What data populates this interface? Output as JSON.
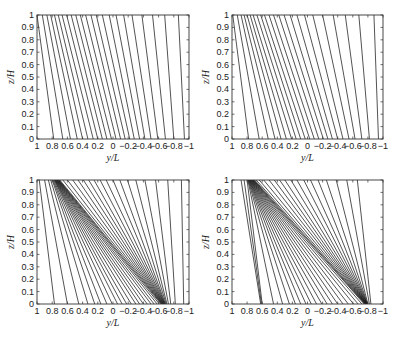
{
  "figure": {
    "width": 400,
    "height": 339,
    "line_color": "#1a1a1a",
    "axes_color": "#333333",
    "background": "#ffffff"
  },
  "chart_data": [
    {
      "id": "top-left",
      "type": "line",
      "title": "",
      "xlabel": "y/L",
      "ylabel": "z/H",
      "xlim": [
        1,
        -1
      ],
      "ylim": [
        0,
        1
      ],
      "x_reversed": true,
      "grid": false,
      "xticks": [
        1,
        0.8,
        0.6,
        0.4,
        0.2,
        0,
        -0.2,
        -0.4,
        -0.6,
        -0.8,
        -1
      ],
      "xtick_labels": [
        "1",
        "0.8",
        "0.6",
        "0.4",
        "0.2",
        "0",
        "−0.2",
        "−0.4",
        "−0.6",
        "−0.8",
        "−1"
      ],
      "yticks": [
        0,
        0.1,
        0.2,
        0.3,
        0.4,
        0.5,
        0.6,
        0.7,
        0.8,
        0.9,
        1
      ],
      "ytick_labels": [
        "0",
        "0.1",
        "0.2",
        "0.3",
        "0.4",
        "0.5",
        "0.6",
        "0.7",
        "0.8",
        "0.9",
        "1"
      ],
      "pixel_box": {
        "x0": 37,
        "y0": 15,
        "x1": 189,
        "y1": 139
      },
      "description": "Nearly parallel streamlines tilted from upper-left to lower-right",
      "lines": [
        {
          "x_top": 1.0,
          "x_bottom": 0.78
        },
        {
          "x_top": 0.93,
          "x_bottom": 0.66
        },
        {
          "x_top": 0.87,
          "x_bottom": 0.56
        },
        {
          "x_top": 0.82,
          "x_bottom": 0.47
        },
        {
          "x_top": 0.77,
          "x_bottom": 0.4
        },
        {
          "x_top": 0.72,
          "x_bottom": 0.33
        },
        {
          "x_top": 0.67,
          "x_bottom": 0.26
        },
        {
          "x_top": 0.61,
          "x_bottom": 0.2
        },
        {
          "x_top": 0.55,
          "x_bottom": 0.14
        },
        {
          "x_top": 0.49,
          "x_bottom": 0.08
        },
        {
          "x_top": 0.43,
          "x_bottom": 0.02
        },
        {
          "x_top": 0.36,
          "x_bottom": -0.04
        },
        {
          "x_top": 0.29,
          "x_bottom": -0.1
        },
        {
          "x_top": 0.22,
          "x_bottom": -0.16
        },
        {
          "x_top": 0.14,
          "x_bottom": -0.22
        },
        {
          "x_top": 0.05,
          "x_bottom": -0.28
        },
        {
          "x_top": -0.04,
          "x_bottom": -0.35
        },
        {
          "x_top": -0.14,
          "x_bottom": -0.42
        },
        {
          "x_top": -0.25,
          "x_bottom": -0.5
        },
        {
          "x_top": -0.38,
          "x_bottom": -0.59
        },
        {
          "x_top": -0.52,
          "x_bottom": -0.69
        },
        {
          "x_top": -0.68,
          "x_bottom": -0.8
        },
        {
          "x_top": -0.86,
          "x_bottom": -0.94
        }
      ]
    },
    {
      "id": "top-right",
      "type": "line",
      "title": "",
      "xlabel": "y/L",
      "ylabel": "z/H",
      "xlim": [
        1,
        -1
      ],
      "ylim": [
        0,
        1
      ],
      "x_reversed": true,
      "grid": false,
      "xticks": [
        1,
        0.8,
        0.6,
        0.4,
        0.2,
        0,
        -0.2,
        -0.4,
        -0.6,
        -0.8,
        -1
      ],
      "xtick_labels": [
        "1",
        "0.8",
        "0.6",
        "0.4",
        "0.2",
        "0",
        "−0.2",
        "−0.4",
        "−0.6",
        "−0.8",
        "−1"
      ],
      "yticks": [
        0,
        0.1,
        0.2,
        0.3,
        0.4,
        0.5,
        0.6,
        0.7,
        0.8,
        0.9,
        1
      ],
      "ytick_labels": [
        "0",
        "0.1",
        "0.2",
        "0.3",
        "0.4",
        "0.5",
        "0.6",
        "0.7",
        "0.8",
        "0.9",
        "1"
      ],
      "pixel_box": {
        "x0": 232,
        "y0": 15,
        "x1": 383,
        "y1": 139
      },
      "description": "Streamlines slightly converging, tilted from upper-left to lower-right",
      "lines": [
        {
          "x_top": 0.99,
          "x_bottom": 0.78
        },
        {
          "x_top": 0.93,
          "x_bottom": 0.64
        },
        {
          "x_top": 0.88,
          "x_bottom": 0.52
        },
        {
          "x_top": 0.84,
          "x_bottom": 0.43
        },
        {
          "x_top": 0.8,
          "x_bottom": 0.35
        },
        {
          "x_top": 0.76,
          "x_bottom": 0.28
        },
        {
          "x_top": 0.72,
          "x_bottom": 0.21
        },
        {
          "x_top": 0.67,
          "x_bottom": 0.15
        },
        {
          "x_top": 0.62,
          "x_bottom": 0.09
        },
        {
          "x_top": 0.57,
          "x_bottom": 0.03
        },
        {
          "x_top": 0.51,
          "x_bottom": -0.03
        },
        {
          "x_top": 0.45,
          "x_bottom": -0.09
        },
        {
          "x_top": 0.38,
          "x_bottom": -0.15
        },
        {
          "x_top": 0.31,
          "x_bottom": -0.21
        },
        {
          "x_top": 0.23,
          "x_bottom": -0.27
        },
        {
          "x_top": 0.14,
          "x_bottom": -0.33
        },
        {
          "x_top": 0.04,
          "x_bottom": -0.4
        },
        {
          "x_top": -0.07,
          "x_bottom": -0.47
        },
        {
          "x_top": -0.2,
          "x_bottom": -0.55
        },
        {
          "x_top": -0.34,
          "x_bottom": -0.63
        },
        {
          "x_top": -0.5,
          "x_bottom": -0.72
        },
        {
          "x_top": -0.68,
          "x_bottom": -0.82
        },
        {
          "x_top": -0.88,
          "x_bottom": -0.94
        }
      ]
    },
    {
      "id": "bottom-left",
      "type": "line",
      "title": "",
      "xlabel": "y/L",
      "ylabel": "z/H",
      "xlim": [
        1,
        -1
      ],
      "ylim": [
        0,
        1
      ],
      "x_reversed": true,
      "grid": false,
      "xticks": [
        1,
        0.8,
        0.6,
        0.4,
        0.2,
        0,
        -0.2,
        -0.4,
        -0.6,
        -0.8,
        -1
      ],
      "xtick_labels": [
        "1",
        "0.8",
        "0.6",
        "0.4",
        "0.2",
        "0",
        "−0.2",
        "−0.4",
        "−0.6",
        "−0.8",
        "−1"
      ],
      "yticks": [
        0,
        0.1,
        0.2,
        0.3,
        0.4,
        0.5,
        0.6,
        0.7,
        0.8,
        0.9,
        1
      ],
      "ytick_labels": [
        "0",
        "0.1",
        "0.2",
        "0.3",
        "0.4",
        "0.5",
        "0.6",
        "0.7",
        "0.8",
        "0.9",
        "1"
      ],
      "pixel_box": {
        "x0": 37,
        "y0": 180,
        "x1": 189,
        "y1": 304
      },
      "description": "Streamlines converging into a dense diagonal band from (0.75,1) to (-0.65,0)",
      "lines": [
        {
          "x_top": 0.97,
          "x_bottom": 0.77
        },
        {
          "x_top": 0.9,
          "x_bottom": 0.6
        },
        {
          "x_top": 0.85,
          "x_bottom": 0.45
        },
        {
          "x_top": 0.82,
          "x_bottom": 0.33
        },
        {
          "x_top": 0.8,
          "x_bottom": 0.24
        },
        {
          "x_top": 0.79,
          "x_bottom": 0.16
        },
        {
          "x_top": 0.78,
          "x_bottom": 0.08
        },
        {
          "x_top": 0.77,
          "x_bottom": 0.01
        },
        {
          "x_top": 0.765,
          "x_bottom": -0.06
        },
        {
          "x_top": 0.76,
          "x_bottom": -0.12
        },
        {
          "x_top": 0.755,
          "x_bottom": -0.18
        },
        {
          "x_top": 0.75,
          "x_bottom": -0.24
        },
        {
          "x_top": 0.745,
          "x_bottom": -0.3
        },
        {
          "x_top": 0.74,
          "x_bottom": -0.35
        },
        {
          "x_top": 0.735,
          "x_bottom": -0.4
        },
        {
          "x_top": 0.73,
          "x_bottom": -0.45
        },
        {
          "x_top": 0.725,
          "x_bottom": -0.5
        },
        {
          "x_top": 0.72,
          "x_bottom": -0.54
        },
        {
          "x_top": 0.715,
          "x_bottom": -0.58
        },
        {
          "x_top": 0.71,
          "x_bottom": -0.61
        },
        {
          "x_top": 0.7,
          "x_bottom": -0.63
        },
        {
          "x_top": 0.66,
          "x_bottom": -0.64
        },
        {
          "x_top": 0.6,
          "x_bottom": -0.645
        },
        {
          "x_top": 0.53,
          "x_bottom": -0.65
        },
        {
          "x_top": 0.46,
          "x_bottom": -0.655
        },
        {
          "x_top": 0.39,
          "x_bottom": -0.66
        },
        {
          "x_top": 0.32,
          "x_bottom": -0.665
        },
        {
          "x_top": 0.25,
          "x_bottom": -0.67
        },
        {
          "x_top": 0.17,
          "x_bottom": -0.675
        },
        {
          "x_top": 0.09,
          "x_bottom": -0.68
        },
        {
          "x_top": 0.0,
          "x_bottom": -0.685
        },
        {
          "x_top": -0.09,
          "x_bottom": -0.69
        },
        {
          "x_top": -0.19,
          "x_bottom": -0.7
        },
        {
          "x_top": -0.3,
          "x_bottom": -0.71
        },
        {
          "x_top": -0.42,
          "x_bottom": -0.73
        },
        {
          "x_top": -0.56,
          "x_bottom": -0.76
        },
        {
          "x_top": -0.72,
          "x_bottom": -0.82
        },
        {
          "x_top": -0.9,
          "x_bottom": -0.93
        }
      ]
    },
    {
      "id": "bottom-right",
      "type": "line",
      "title": "",
      "xlabel": "y/L",
      "ylabel": "z/H",
      "xlim": [
        1,
        -1
      ],
      "ylim": [
        0,
        1
      ],
      "x_reversed": true,
      "grid": false,
      "xticks": [
        1,
        0.8,
        0.6,
        0.4,
        0.2,
        0,
        -0.2,
        -0.4,
        -0.6,
        -0.8,
        -1
      ],
      "xtick_labels": [
        "1",
        "0.8",
        "0.6",
        "0.4",
        "0.2",
        "0",
        "−0.2",
        "−0.4",
        "−0.6",
        "−0.8",
        "−1"
      ],
      "yticks": [
        0,
        0.1,
        0.2,
        0.3,
        0.4,
        0.5,
        0.6,
        0.7,
        0.8,
        0.9,
        1
      ],
      "ytick_labels": [
        "0",
        "0.1",
        "0.2",
        "0.3",
        "0.4",
        "0.5",
        "0.6",
        "0.7",
        "0.8",
        "0.9",
        "1"
      ],
      "pixel_box": {
        "x0": 232,
        "y0": 180,
        "x1": 383,
        "y1": 304
      },
      "description": "Strongly converging streamlines forming a dark front from (0.8,1) to (-0.78,0)",
      "lines": [
        {
          "x_top": 0.8,
          "x_bottom": 0.6
        },
        {
          "x_top": 0.79,
          "x_bottom": 0.45
        },
        {
          "x_top": 0.785,
          "x_bottom": 0.33
        },
        {
          "x_top": 0.78,
          "x_bottom": 0.24
        },
        {
          "x_top": 0.775,
          "x_bottom": 0.16
        },
        {
          "x_top": 0.77,
          "x_bottom": 0.09
        },
        {
          "x_top": 0.765,
          "x_bottom": 0.02
        },
        {
          "x_top": 0.76,
          "x_bottom": -0.05
        },
        {
          "x_top": 0.755,
          "x_bottom": -0.12
        },
        {
          "x_top": 0.75,
          "x_bottom": -0.19
        },
        {
          "x_top": 0.745,
          "x_bottom": -0.26
        },
        {
          "x_top": 0.74,
          "x_bottom": -0.33
        },
        {
          "x_top": 0.735,
          "x_bottom": -0.4
        },
        {
          "x_top": 0.73,
          "x_bottom": -0.47
        },
        {
          "x_top": 0.725,
          "x_bottom": -0.54
        },
        {
          "x_top": 0.72,
          "x_bottom": -0.61
        },
        {
          "x_top": 0.715,
          "x_bottom": -0.67
        },
        {
          "x_top": 0.71,
          "x_bottom": -0.72
        },
        {
          "x_top": 0.7,
          "x_bottom": -0.75
        },
        {
          "x_top": 0.68,
          "x_bottom": -0.76
        },
        {
          "x_top": 0.64,
          "x_bottom": -0.765
        },
        {
          "x_top": 0.58,
          "x_bottom": -0.77
        },
        {
          "x_top": 0.51,
          "x_bottom": -0.772
        },
        {
          "x_top": 0.44,
          "x_bottom": -0.775
        },
        {
          "x_top": 0.37,
          "x_bottom": -0.777
        },
        {
          "x_top": 0.3,
          "x_bottom": -0.78
        },
        {
          "x_top": 0.22,
          "x_bottom": -0.782
        },
        {
          "x_top": 0.14,
          "x_bottom": -0.785
        },
        {
          "x_top": 0.05,
          "x_bottom": -0.787
        },
        {
          "x_top": -0.04,
          "x_bottom": -0.79
        },
        {
          "x_top": -0.14,
          "x_bottom": -0.792
        },
        {
          "x_top": -0.25,
          "x_bottom": -0.795
        },
        {
          "x_top": -0.38,
          "x_bottom": -0.8
        },
        {
          "x_top": -0.52,
          "x_bottom": -0.82
        },
        {
          "x_top": -0.66,
          "x_bottom": -0.84
        }
      ],
      "extra_lines": [
        {
          "x_top": 0.88,
          "x_bottom": 0.62,
          "note": "left outer lines"
        },
        {
          "x_top": 0.84,
          "x_bottom": 0.61
        }
      ]
    }
  ]
}
